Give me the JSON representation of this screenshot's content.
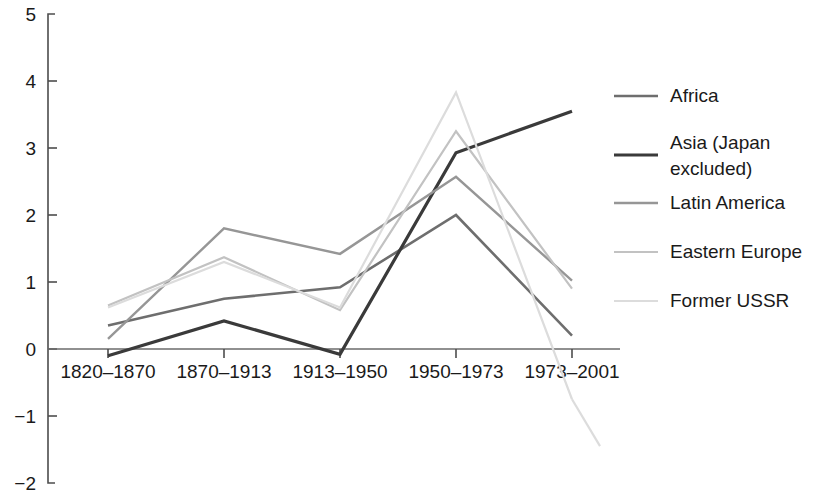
{
  "chart_data": {
    "type": "line",
    "title": "",
    "subtitle": "",
    "xlabel": "",
    "ylabel": "",
    "categories": [
      "1820–1870",
      "1870–1913",
      "1913–1950",
      "1950–1973",
      "1973–2001"
    ],
    "x_tick_labels": [
      "1820–1870",
      "1870–1913",
      "1913–1950",
      "1950–1973",
      "1973–2001"
    ],
    "y_tick_labels": [
      "5",
      "4",
      "3",
      "2",
      "1",
      "0",
      "−1",
      "−2"
    ],
    "y_tick_values": [
      5,
      4,
      3,
      2,
      1,
      0,
      -1,
      -2
    ],
    "ylim": [
      -2,
      5
    ],
    "grid": false,
    "legend_position": "right",
    "zero_line": true,
    "series": [
      {
        "name": "Africa",
        "color": "#6e6e6e",
        "width": 2.6,
        "values": [
          0.35,
          0.75,
          0.92,
          2.0,
          0.2
        ]
      },
      {
        "name": "Asia (Japan excluded)",
        "color": "#3a3a3a",
        "width": 3.2,
        "values": [
          -0.1,
          0.42,
          -0.08,
          2.93,
          3.55
        ]
      },
      {
        "name": "Latin America",
        "color": "#969696",
        "width": 2.4,
        "values": [
          0.15,
          1.8,
          1.42,
          2.57,
          1.02
        ]
      },
      {
        "name": "Eastern Europe",
        "color": "#c2c2c2",
        "width": 2.2,
        "values": [
          0.65,
          1.37,
          0.58,
          3.25,
          0.9
        ]
      },
      {
        "name": "Former USSR",
        "color": "#dcdcdc",
        "width": 2.2,
        "values": [
          0.62,
          1.3,
          0.62,
          3.83,
          -0.75
        ]
      }
    ]
  },
  "legend": {
    "entries": [
      {
        "label": "Africa",
        "color": "#6e6e6e"
      },
      {
        "label": "Asia (Japan excluded)",
        "color": "#3a3a3a"
      },
      {
        "label": "Latin America",
        "color": "#969696"
      },
      {
        "label": "Eastern Europe",
        "color": "#c2c2c2"
      },
      {
        "label": "Former USSR",
        "color": "#dcdcdc"
      }
    ]
  }
}
